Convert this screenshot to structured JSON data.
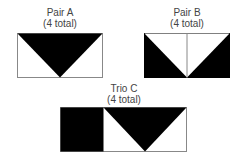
{
  "blocks": [
    {
      "title": "Pair A",
      "subtitle": "(4 total)"
    },
    {
      "title": "Pair B",
      "subtitle": "(4 total)"
    },
    {
      "title": "Trio C",
      "subtitle": "(4 total)"
    }
  ],
  "colors": {
    "fill": "#000000",
    "background": "#ffffff",
    "stroke": "#888888"
  }
}
